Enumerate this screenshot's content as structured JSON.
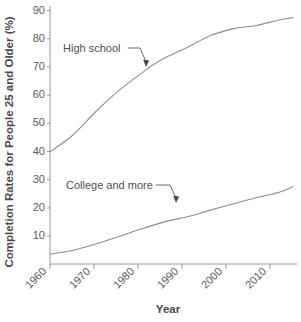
{
  "chart_data": {
    "type": "line",
    "title": "",
    "xlabel": "Year",
    "ylabel": "Completion Rates for People 25 and Older (%)",
    "xlim": [
      1960,
      2013
    ],
    "ylim": [
      2,
      92
    ],
    "xticks": [
      1960,
      1970,
      1980,
      1990,
      2000,
      2010
    ],
    "xticklabels": [
      "1960",
      "1970",
      "1980",
      "1990",
      "2000",
      "2010"
    ],
    "yticks": [
      10,
      20,
      30,
      40,
      50,
      60,
      70,
      80,
      90
    ],
    "yticklabels": [
      "10",
      "20",
      "30",
      "40",
      "50",
      "60",
      "70",
      "80",
      "90"
    ],
    "grid": false,
    "legend": "none",
    "annotations": [
      {
        "text": "High school",
        "series": "High school"
      },
      {
        "text": "College and more",
        "series": "College and more"
      }
    ],
    "series": [
      {
        "name": "High school",
        "color": "#8d8d8d",
        "x": [
          1960,
          1965,
          1970,
          1975,
          1980,
          1982,
          1985,
          1990,
          1995,
          2000,
          2002,
          2005,
          2010,
          2013
        ],
        "values": [
          41.1,
          47.0,
          55.2,
          62.5,
          68.6,
          71.0,
          73.9,
          77.6,
          81.7,
          84.1,
          84.6,
          85.2,
          87.1,
          88.0
        ]
      },
      {
        "name": "College and more",
        "color": "#8d8d8d",
        "x": [
          1960,
          1965,
          1970,
          1975,
          1980,
          1985,
          1990,
          1993,
          1995,
          2000,
          2005,
          2010,
          2013
        ],
        "values": [
          5.4,
          6.8,
          9.0,
          11.6,
          14.3,
          16.7,
          18.5,
          19.8,
          20.8,
          23.0,
          25.1,
          27.0,
          29.0
        ]
      }
    ]
  },
  "axis_titles": {
    "x": "Year",
    "y": "Completion Rates for People 25 and Older (%)"
  }
}
